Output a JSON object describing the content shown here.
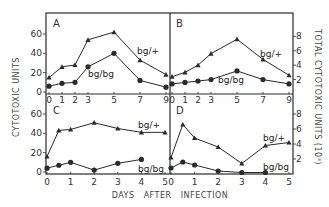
{
  "chart_data": [
    {
      "panel": "A",
      "type": "line",
      "x": [
        0,
        1,
        2,
        3,
        5,
        7,
        9
      ],
      "xticks": [
        "0",
        "1",
        "2",
        "3",
        "5",
        "7",
        "9"
      ],
      "ylabel": "CYTOTOXIC UNITS",
      "ylim": [
        0,
        70
      ],
      "yticks": [
        0,
        20,
        40,
        60
      ],
      "series": [
        {
          "name": "bg/+",
          "marker": "triangle",
          "values": [
            15,
            26,
            28,
            54,
            62,
            33,
            18
          ]
        },
        {
          "name": "bg/bg",
          "marker": "circle",
          "values": [
            6,
            9,
            10,
            26,
            40,
            12,
            5
          ]
        }
      ]
    },
    {
      "panel": "B",
      "type": "line",
      "x": [
        0,
        1,
        2,
        3,
        5,
        7,
        9
      ],
      "xticks": [
        "0",
        "1",
        "2",
        "3",
        "5",
        "7",
        "9"
      ],
      "ylabel": "TOTAL CYTOTOXIC UNITS (10^3)",
      "ylim": [
        0,
        10
      ],
      "yticks": [
        2,
        4,
        6,
        8
      ],
      "series": [
        {
          "name": "bg/+",
          "marker": "triangle",
          "values": [
            2.4,
            3.0,
            4.0,
            5.6,
            7.6,
            4.8,
            2.6
          ]
        },
        {
          "name": "bg/bg",
          "marker": "circle",
          "values": [
            1.4,
            1.6,
            1.8,
            2.0,
            3.2,
            2.0,
            1.4
          ]
        }
      ]
    },
    {
      "panel": "C",
      "type": "line",
      "xticks": [
        "0",
        "1",
        "2",
        "3",
        "4",
        "5"
      ],
      "ylabel": "CYTOTOXIC UNITS",
      "ylim": [
        0,
        70
      ],
      "yticks": [
        0,
        20,
        40,
        60
      ],
      "series": [
        {
          "name": "bg/+",
          "marker": "triangle",
          "x": [
            0,
            0.5,
            1,
            2,
            3,
            4,
            5
          ],
          "values": [
            16,
            43,
            44,
            51,
            45,
            41,
            41
          ]
        },
        {
          "name": "bg/bg",
          "marker": "circle",
          "x": [
            0,
            0.5,
            1,
            2,
            3,
            4
          ],
          "values": [
            4,
            7,
            10,
            2,
            9,
            13
          ]
        }
      ]
    },
    {
      "panel": "D",
      "type": "line",
      "xticks": [
        "0",
        "1",
        "2",
        "3",
        "4",
        "5"
      ],
      "ylabel": "TOTAL CYTOTOXIC UNITS (10^3)",
      "ylim": [
        0,
        10
      ],
      "yticks": [
        2,
        4,
        6,
        8
      ],
      "series": [
        {
          "name": "bg/+",
          "marker": "triangle",
          "x": [
            0,
            0.5,
            1,
            2,
            3,
            4,
            5
          ],
          "values": [
            2.2,
            6.6,
            4.8,
            3.6,
            1.4,
            3.8,
            4.2
          ]
        },
        {
          "name": "bg/bg",
          "marker": "circle",
          "x": [
            0,
            0.5,
            1,
            2,
            3,
            4
          ],
          "values": [
            0.8,
            1.6,
            1.2,
            0.4,
            0.2,
            0.2
          ]
        }
      ]
    }
  ],
  "labels": {
    "left_axis": "CYTOTOXIC UNITS",
    "right_axis": "TOTAL CYTOTOXIC UNITS (10³)",
    "x_axis": "DAYS   AFTER   INFECTION",
    "panel_a": "A",
    "panel_b": "B",
    "panel_c": "C",
    "panel_d": "D",
    "bg_plus": "bg/+",
    "bg_bg": "bg/bg"
  },
  "colors": {
    "ink": "#2a2a2a",
    "background": "#ffffff"
  }
}
